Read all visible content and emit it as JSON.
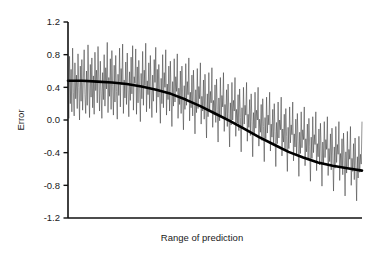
{
  "chart_data": {
    "type": "line",
    "title": "",
    "xlabel": "Range of prediction",
    "ylabel": "Error",
    "xlim": [
      0,
      1
    ],
    "ylim": [
      -1.2,
      1.2
    ],
    "grid": false,
    "legend": "none",
    "y_ticks": [
      1.2,
      0.8,
      0.4,
      0.0,
      -0.4,
      -0.8,
      -1.2
    ],
    "y_tick_labels": [
      "1.2",
      "0.8",
      "0.4",
      "0.0",
      "-0.4",
      "-0.8",
      "-1.2"
    ],
    "x_ticks": [],
    "x_tick_labels": [],
    "annotations": [],
    "series": [
      {
        "name": "residual-noise",
        "type": "line",
        "color": "#3a3a3a",
        "linewidth": 0.55,
        "description": "dense high-frequency residual error scatter about the trend",
        "noise_envelope": {
          "upper_at_x": [
            0.95,
            0.95,
            0.92,
            0.86,
            0.72,
            0.54,
            0.33,
            0.15,
            0.02,
            -0.06,
            -0.1
          ],
          "lower_at_x": [
            -0.02,
            -0.02,
            -0.06,
            -0.16,
            -0.3,
            -0.46,
            -0.62,
            -0.76,
            -0.88,
            -0.96,
            -1.0
          ],
          "x_positions": [
            0.0,
            0.1,
            0.2,
            0.3,
            0.4,
            0.5,
            0.6,
            0.7,
            0.8,
            0.9,
            1.0
          ]
        },
        "values": [
          0.48,
          0.02,
          0.78,
          0.2,
          0.62,
          0.1,
          0.88,
          0.34,
          0.05,
          0.7,
          0.26,
          0.55,
          0.14,
          0.81,
          0.4,
          0.0,
          0.66,
          0.23,
          0.74,
          0.12,
          0.5,
          0.86,
          0.31,
          0.08,
          0.6,
          0.18,
          0.92,
          0.44,
          0.03,
          0.68,
          0.28,
          0.76,
          0.15,
          0.54,
          0.07,
          0.83,
          0.36,
          0.61,
          0.21,
          0.9,
          0.47,
          0.11,
          0.72,
          0.33,
          0.02,
          0.58,
          0.25,
          0.8,
          0.17,
          0.64,
          0.38,
          0.95,
          0.09,
          0.52,
          0.29,
          0.75,
          0.13,
          0.85,
          0.41,
          0.06,
          0.67,
          0.22,
          0.79,
          0.35,
          0.01,
          0.56,
          0.3,
          0.88,
          0.16,
          0.63,
          0.43,
          0.93,
          0.08,
          0.49,
          0.27,
          0.71,
          0.19,
          0.82,
          0.37,
          0.04,
          0.59,
          0.24,
          0.77,
          0.32,
          0.91,
          0.12,
          0.53,
          0.45,
          0.87,
          0.07,
          0.65,
          0.21,
          0.73,
          0.39,
          -0.02,
          0.57,
          0.26,
          0.84,
          0.18,
          0.61,
          0.42,
          0.94,
          0.1,
          0.48,
          0.31,
          0.7,
          0.14,
          0.79,
          0.36,
          0.03,
          0.55,
          0.23,
          0.74,
          0.46,
          0.89,
          0.09,
          0.62,
          0.28,
          0.68,
          0.33,
          -0.04,
          0.51,
          0.2,
          0.8,
          0.15,
          0.58,
          0.4,
          0.86,
          0.06,
          0.44,
          0.25,
          0.66,
          0.11,
          0.72,
          0.3,
          -0.08,
          0.47,
          0.17,
          0.75,
          0.22,
          0.53,
          0.35,
          0.81,
          0.02,
          0.39,
          0.19,
          0.6,
          0.08,
          0.66,
          0.27,
          -0.12,
          0.42,
          0.13,
          0.69,
          0.18,
          0.47,
          0.31,
          0.76,
          -0.01,
          0.34,
          0.15,
          0.55,
          0.05,
          0.61,
          0.23,
          -0.17,
          0.37,
          0.09,
          0.63,
          0.14,
          0.41,
          0.26,
          0.7,
          -0.05,
          0.29,
          0.11,
          0.49,
          0.01,
          0.56,
          0.18,
          -0.22,
          0.32,
          0.04,
          0.58,
          0.1,
          0.35,
          0.21,
          0.64,
          -0.09,
          0.24,
          0.06,
          0.43,
          -0.03,
          0.5,
          0.13,
          -0.27,
          0.27,
          -0.01,
          0.52,
          0.05,
          0.3,
          0.16,
          0.58,
          -0.14,
          0.19,
          0.01,
          0.37,
          -0.08,
          0.44,
          0.08,
          -0.33,
          0.21,
          -0.06,
          0.46,
          0.0,
          0.24,
          0.11,
          0.52,
          -0.2,
          0.13,
          -0.04,
          0.31,
          -0.13,
          0.38,
          0.03,
          -0.39,
          0.15,
          -0.11,
          0.4,
          -0.05,
          0.18,
          0.06,
          0.46,
          -0.26,
          0.07,
          -0.09,
          0.25,
          -0.19,
          0.32,
          -0.02,
          -0.45,
          0.09,
          -0.17,
          0.34,
          -0.1,
          0.12,
          0.0,
          0.4,
          -0.32,
          0.01,
          -0.15,
          0.19,
          -0.25,
          0.26,
          -0.08,
          -0.51,
          0.03,
          -0.23,
          0.28,
          -0.16,
          0.06,
          -0.06,
          0.34,
          -0.38,
          -0.05,
          -0.21,
          0.13,
          -0.31,
          0.2,
          -0.14,
          -0.57,
          -0.03,
          -0.29,
          0.22,
          -0.22,
          0.0,
          -0.12,
          0.28,
          -0.44,
          -0.11,
          -0.27,
          0.07,
          -0.37,
          0.14,
          -0.2,
          -0.63,
          -0.09,
          -0.35,
          0.16,
          -0.28,
          -0.06,
          -0.18,
          0.22,
          -0.5,
          -0.17,
          -0.33,
          0.01,
          -0.43,
          0.08,
          -0.26,
          -0.69,
          -0.15,
          -0.41,
          0.1,
          -0.34,
          -0.12,
          -0.24,
          0.16,
          -0.56,
          -0.23,
          -0.39,
          -0.05,
          -0.49,
          0.02,
          -0.32,
          -0.75,
          -0.21,
          -0.47,
          0.04,
          -0.4,
          -0.18,
          -0.3,
          0.1,
          -0.62,
          -0.29,
          -0.45,
          -0.11,
          -0.55,
          -0.04,
          -0.38,
          -0.81,
          -0.27,
          -0.53,
          -0.02,
          -0.46,
          -0.24,
          -0.36,
          0.04,
          -0.68,
          -0.35,
          -0.51,
          -0.17,
          -0.61,
          -0.1,
          -0.44,
          -0.87,
          -0.33,
          -0.59,
          -0.08,
          -0.52,
          -0.3,
          -0.42,
          -0.02,
          -0.74,
          -0.41,
          -0.57,
          -0.23,
          -0.67,
          -0.16,
          -0.5,
          -0.93,
          -0.39,
          -0.65,
          -0.14,
          -0.58,
          -0.36,
          -0.48,
          -0.08,
          -0.8,
          -0.47,
          -0.63,
          -0.29,
          -0.73,
          -0.22,
          -0.56,
          -0.99,
          -0.45,
          -0.71,
          -0.2,
          -0.64,
          -0.42,
          -0.54,
          -0.02
        ]
      },
      {
        "name": "smooth-trend",
        "type": "line",
        "color": "#000000",
        "linewidth": 2.6,
        "description": "thick smoothed sigmoid trend of the error versus range of prediction",
        "x": [
          0.0,
          0.05,
          0.1,
          0.15,
          0.2,
          0.25,
          0.3,
          0.35,
          0.4,
          0.45,
          0.5,
          0.55,
          0.6,
          0.65,
          0.7,
          0.75,
          0.8,
          0.85,
          0.9,
          0.95,
          1.0
        ],
        "values": [
          0.48,
          0.48,
          0.47,
          0.46,
          0.44,
          0.41,
          0.37,
          0.32,
          0.25,
          0.17,
          0.08,
          -0.01,
          -0.11,
          -0.21,
          -0.3,
          -0.39,
          -0.46,
          -0.52,
          -0.56,
          -0.59,
          -0.62
        ]
      }
    ]
  }
}
